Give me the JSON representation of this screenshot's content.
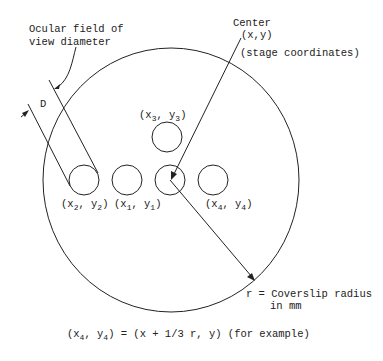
{
  "diagram": {
    "labels": {
      "ocular_line1": "Ocular field of",
      "ocular_line2": "view diameter",
      "d_label": "D",
      "center_line1": "Center",
      "center_line2": "(x,y)",
      "stage_coords": "(stage coordinates)",
      "radius_line1": "r = Coverslip radius",
      "radius_line2": "in mm",
      "formula": "(x4, y4) = (x + 1/3 r, y) (for example)"
    },
    "fields": [
      {
        "name": "x2",
        "var_x": "x",
        "sub_x": "2",
        "var_y": "y",
        "sub_y": "2"
      },
      {
        "name": "x1",
        "var_x": "x",
        "sub_x": "1",
        "var_y": "y",
        "sub_y": "1"
      },
      {
        "name": "x3",
        "var_x": "x",
        "sub_x": "3",
        "var_y": "y",
        "sub_y": "3"
      },
      {
        "name": "x4",
        "var_x": "x",
        "sub_x": "4",
        "var_y": "y",
        "sub_y": "4"
      }
    ],
    "formula_parts": {
      "open": "(x",
      "sub4a": "4",
      "mid": ", y",
      "sub4b": "4",
      "rest": ") = (x + 1/3 r, y) (for example)"
    },
    "colors": {
      "ink": "#222222",
      "background": "#ffffff"
    }
  }
}
